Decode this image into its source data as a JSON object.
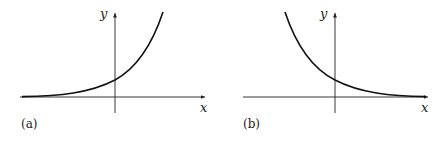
{
  "panels": [
    {
      "caption": "(a)",
      "x_label": "x",
      "y_label": "y",
      "curve": "exponential growth (y = a^x, a > 1)"
    },
    {
      "caption": "(b)",
      "x_label": "x",
      "y_label": "y",
      "curve": "exponential decay (y = a^x, 0 < a < 1)"
    }
  ],
  "colors": {
    "line": "#111111",
    "background": "#ffffff"
  }
}
